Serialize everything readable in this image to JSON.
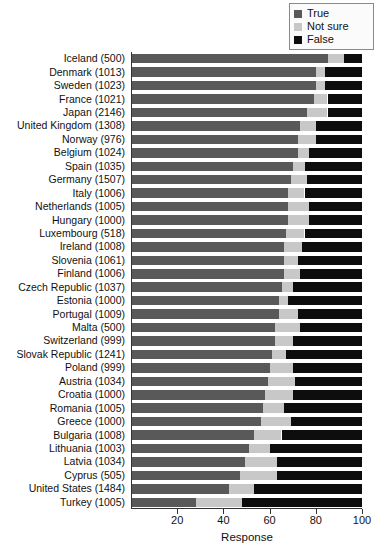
{
  "chart_data": {
    "type": "bar",
    "orientation": "horizontal",
    "stacked": true,
    "percent": true,
    "title": "",
    "xlabel": "Response",
    "ylabel": "",
    "xlim": [
      0,
      100
    ],
    "xticks": [
      20,
      40,
      60,
      80,
      100
    ],
    "xticklabels": [
      "20",
      "40",
      "60",
      "80",
      "100"
    ],
    "grid": false,
    "legend_position": "top-right",
    "categories": [
      "Iceland (500)",
      "Denmark (1013)",
      "Sweden (1023)",
      "France (1021)",
      "Japan (2146)",
      "United Kingdom (1308)",
      "Norway (976)",
      "Belgium (1024)",
      "Spain (1035)",
      "Germany (1507)",
      "Italy (1006)",
      "Netherlands (1005)",
      "Hungary (1000)",
      "Luxembourg (518)",
      "Ireland (1008)",
      "Slovenia (1061)",
      "Finland (1006)",
      "Czech Republic (1037)",
      "Estonia (1000)",
      "Portugal (1009)",
      "Malta (500)",
      "Switzerland (999)",
      "Slovak Republic (1241)",
      "Poland (999)",
      "Austria (1034)",
      "Croatia (1000)",
      "Romania (1005)",
      "Greece (1000)",
      "Bulgaria (1008)",
      "Lithuania (1003)",
      "Latvia (1034)",
      "Cyprus (505)",
      "United States (1484)",
      "Turkey (1005)"
    ],
    "series": [
      {
        "name": "True",
        "color": "#595959",
        "values": [
          85,
          80,
          80,
          79,
          76,
          73,
          72,
          72,
          70,
          69,
          68,
          68,
          68,
          67,
          66,
          66,
          66,
          65,
          64,
          64,
          62,
          62,
          61,
          60,
          59,
          58,
          57,
          56,
          53,
          51,
          49,
          47,
          42,
          28
        ]
      },
      {
        "name": "Not sure",
        "color": "#c8c8c8",
        "values": [
          7,
          4,
          4,
          6,
          9,
          7,
          8,
          5,
          5,
          7,
          7,
          9,
          9,
          8,
          8,
          6,
          7,
          5,
          4,
          8,
          11,
          8,
          6,
          10,
          12,
          12,
          9,
          13,
          12,
          9,
          14,
          16,
          11,
          20
        ]
      },
      {
        "name": "False",
        "color": "#0d0d0d",
        "values": [
          8,
          16,
          16,
          15,
          15,
          20,
          20,
          23,
          25,
          24,
          25,
          23,
          23,
          25,
          26,
          28,
          27,
          30,
          32,
          28,
          27,
          30,
          33,
          30,
          29,
          30,
          34,
          31,
          35,
          40,
          37,
          37,
          47,
          52
        ]
      }
    ]
  },
  "legend": {
    "items": [
      {
        "label": "True",
        "color": "#595959"
      },
      {
        "label": "Not sure",
        "color": "#c8c8c8"
      },
      {
        "label": "False",
        "color": "#0d0d0d"
      }
    ]
  }
}
